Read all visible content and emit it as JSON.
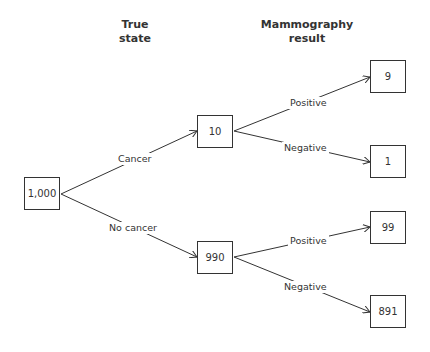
{
  "headers": {
    "true_state": {
      "line1": "True",
      "line2": "state"
    },
    "mammography": {
      "line1": "Mammography",
      "line2": "result"
    }
  },
  "nodes": {
    "root": "1,000",
    "cancer": "10",
    "no_cancer": "990",
    "cancer_positive": "9",
    "cancer_negative": "1",
    "no_cancer_positive": "99",
    "no_cancer_negative": "891"
  },
  "edges": {
    "cancer": "Cancer",
    "no_cancer": "No cancer",
    "cancer_positive": "Positive",
    "cancer_negative": "Negative",
    "no_cancer_positive": "Positive",
    "no_cancer_negative": "Negative"
  }
}
